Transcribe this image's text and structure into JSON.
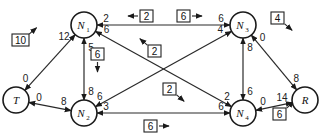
{
  "diagram": {
    "type": "flow-network",
    "nodes": [
      {
        "id": "T",
        "label": "T",
        "sub": "",
        "x": 16,
        "y": 100
      },
      {
        "id": "N1",
        "label": "N",
        "sub": "1",
        "x": 84,
        "y": 25
      },
      {
        "id": "N2",
        "label": "N",
        "sub": "2",
        "x": 84,
        "y": 113
      },
      {
        "id": "N3",
        "label": "N",
        "sub": "3",
        "x": 243,
        "y": 25
      },
      {
        "id": "N4",
        "label": "N",
        "sub": "4",
        "x": 243,
        "y": 113
      },
      {
        "id": "R",
        "label": "R",
        "sub": "",
        "x": 305,
        "y": 100
      }
    ],
    "edges": [
      {
        "from": "T",
        "to": "N1",
        "cap_from": "0",
        "cap_to": "12"
      },
      {
        "from": "T",
        "to": "N2",
        "cap_from": "0",
        "cap_to": "8"
      },
      {
        "from": "N1",
        "to": "N3",
        "cap_from": "2",
        "cap_to": "6"
      },
      {
        "from": "N1",
        "to": "N2",
        "cap_from": "5",
        "cap_to": "8"
      },
      {
        "from": "N1",
        "to": "N4",
        "cap_from": "6",
        "cap_to": "2"
      },
      {
        "from": "N2",
        "to": "N3",
        "cap_from": "6",
        "cap_to": "4"
      },
      {
        "from": "N2",
        "to": "N4",
        "cap_from": "3",
        "cap_to": "6"
      },
      {
        "from": "N3",
        "to": "N4",
        "cap_from": "8",
        "cap_to": "6"
      },
      {
        "from": "N3",
        "to": "R",
        "cap_from": "0",
        "cap_to": "8"
      },
      {
        "from": "N4",
        "to": "R",
        "cap_from": "0",
        "cap_to": "14"
      }
    ],
    "flow_boxes": [
      {
        "value": "10",
        "x": 12,
        "y": 34,
        "dir": "up-right"
      },
      {
        "value": "2",
        "x": 140,
        "y": 10,
        "dir": "left"
      },
      {
        "value": "6",
        "x": 177,
        "y": 10,
        "dir": "right"
      },
      {
        "value": "6",
        "x": 91,
        "y": 48,
        "dir": "down"
      },
      {
        "value": "2",
        "x": 148,
        "y": 45,
        "dir": "up-left"
      },
      {
        "value": "4",
        "x": 271,
        "y": 12,
        "dir": "down-right"
      },
      {
        "value": "2",
        "x": 163,
        "y": 83,
        "dir": "down-right"
      },
      {
        "value": "6",
        "x": 144,
        "y": 120,
        "dir": "right"
      },
      {
        "value": "6",
        "x": 273,
        "y": 108,
        "dir": "up-right"
      }
    ]
  }
}
